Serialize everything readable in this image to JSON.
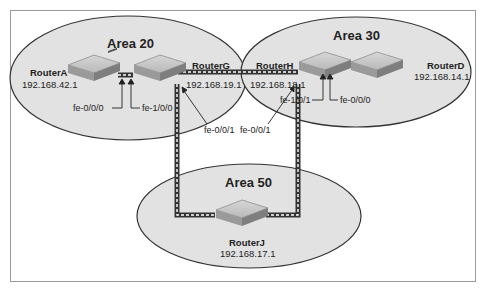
{
  "diagram": {
    "type": "ospf-network-topology",
    "areas": [
      {
        "id": "area20",
        "label": "Area 20"
      },
      {
        "id": "area30",
        "label": "Area 30"
      },
      {
        "id": "area50",
        "label": "Area 50"
      }
    ],
    "routers": [
      {
        "id": "routerA",
        "name": "RouterA",
        "ip": "192.168.42.1",
        "area": "Area 20"
      },
      {
        "id": "routerG",
        "name": "RouterG",
        "ip": "192.168.19.1",
        "area": "Area 20"
      },
      {
        "id": "routerH",
        "name": "RouterH",
        "ip": "192.168.18.1",
        "area": "Area 30"
      },
      {
        "id": "routerD",
        "name": "RouterD",
        "ip": "192.168.14.1",
        "area": "Area 30"
      },
      {
        "id": "routerJ",
        "name": "RouterJ",
        "ip": "192.168.17.1",
        "area": "Area 50"
      }
    ],
    "interfaces": {
      "a_g_left": "fe-0/0/0",
      "a_g_right": "fe-1/0/0",
      "g_down": "fe-0/0/1",
      "h_down": "fe-0/0/1",
      "h_d_left": "fe-1/0/1",
      "h_d_right": "fe-0/0/0"
    },
    "links": [
      {
        "from": "RouterA",
        "to": "RouterG"
      },
      {
        "from": "RouterG",
        "to": "RouterH"
      },
      {
        "from": "RouterH",
        "to": "RouterD"
      },
      {
        "from": "RouterG",
        "to": "RouterJ"
      },
      {
        "from": "RouterH",
        "to": "RouterJ"
      }
    ]
  }
}
